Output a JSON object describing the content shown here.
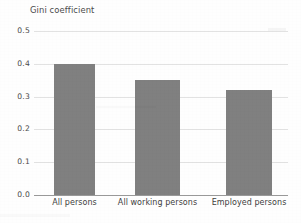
{
  "chart_data": {
    "type": "bar",
    "title": "Gini coefficient",
    "xlabel": "",
    "ylabel": "",
    "categories": [
      "All persons",
      "All working persons",
      "Employed persons"
    ],
    "values": [
      0.4,
      0.35,
      0.32
    ],
    "ylim": [
      0.0,
      0.5
    ],
    "ytick_labels": [
      "0.0",
      "0.1",
      "0.2",
      "0.3",
      "0.4",
      "0.5"
    ],
    "ytick_values": [
      0.0,
      0.1,
      0.2,
      0.3,
      0.4,
      0.5
    ],
    "grid": true,
    "legend": false,
    "legend_position": "none",
    "bar_color": "#808080",
    "gridline_color": "#e2e2e2",
    "axis_color": "#9a9a9a",
    "background_color": "#fefefe"
  }
}
